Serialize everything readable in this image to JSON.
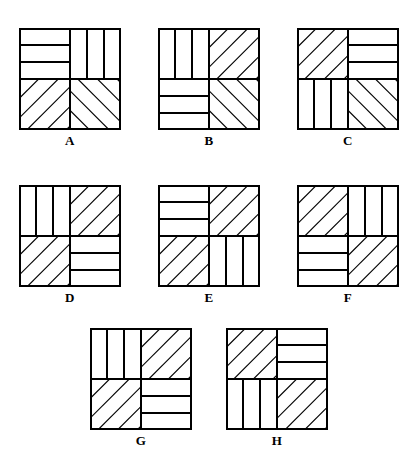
{
  "sheet": {
    "title": "Quadrant Stripe Pattern Figures",
    "background_color": "#ffffff",
    "line_color": "#000000",
    "figure_count": 8,
    "rows": [
      {
        "row_label": "row-1",
        "figures": [
          "A",
          "B",
          "C"
        ]
      },
      {
        "row_label": "row-2",
        "figures": [
          "D",
          "E",
          "F"
        ]
      },
      {
        "row_label": "row-3",
        "figures": [
          "G",
          "H"
        ]
      }
    ]
  },
  "legend": {
    "pattern_names": {
      "horizontal": "horizontal-stripes",
      "vertical": "vertical-stripes",
      "diag_up": "diagonal-stripes-up-right",
      "diag_down": "diagonal-stripes-down-right"
    },
    "stripes_per_quadrant": 3,
    "diagonal_line_count": 4
  },
  "figures": [
    {
      "label": "A",
      "quadrants": {
        "top_left": "horizontal",
        "top_right": "vertical",
        "bottom_left": "diag_up",
        "bottom_right": "diag_down"
      }
    },
    {
      "label": "B",
      "quadrants": {
        "top_left": "vertical",
        "top_right": "diag_up",
        "bottom_left": "horizontal",
        "bottom_right": "diag_down"
      }
    },
    {
      "label": "C",
      "quadrants": {
        "top_left": "diag_up",
        "top_right": "horizontal",
        "bottom_left": "vertical",
        "bottom_right": "diag_down"
      }
    },
    {
      "label": "D",
      "quadrants": {
        "top_left": "vertical",
        "top_right": "diag_up",
        "bottom_left": "diag_up",
        "bottom_right": "horizontal"
      }
    },
    {
      "label": "E",
      "quadrants": {
        "top_left": "horizontal",
        "top_right": "diag_up",
        "bottom_left": "diag_up",
        "bottom_right": "vertical"
      }
    },
    {
      "label": "F",
      "quadrants": {
        "top_left": "diag_up",
        "top_right": "vertical",
        "bottom_left": "horizontal",
        "bottom_right": "diag_up"
      }
    },
    {
      "label": "G",
      "quadrants": {
        "top_left": "vertical",
        "top_right": "diag_up",
        "bottom_left": "diag_up",
        "bottom_right": "horizontal"
      }
    },
    {
      "label": "H",
      "quadrants": {
        "top_left": "diag_up",
        "top_right": "horizontal",
        "bottom_left": "vertical",
        "bottom_right": "diag_up"
      }
    }
  ]
}
